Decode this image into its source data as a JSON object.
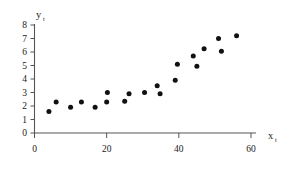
{
  "chart_data": {
    "type": "scatter",
    "title": "",
    "subtitle": "",
    "xlabel": "x",
    "xlabel_sub": "t",
    "ylabel": "y",
    "ylabel_sub": "t",
    "xlim": [
      0,
      62
    ],
    "ylim": [
      0,
      8
    ],
    "xticks": [
      0,
      20,
      40,
      60
    ],
    "xtick_labels": [
      "0",
      "20",
      "40",
      "60"
    ],
    "yticks": [
      0,
      1,
      2,
      3,
      4,
      5,
      6,
      7,
      8
    ],
    "ytick_labels": [
      "0",
      "1",
      "2",
      "3",
      "4",
      "5",
      "6",
      "7",
      "8"
    ],
    "grid": false,
    "legend": false,
    "legend_position": "none",
    "marker": "filled-circle",
    "marker_color": "#111111",
    "axis_color": "#555555",
    "background_color": "#ffffff",
    "series": [
      {
        "name": "observations",
        "points": [
          {
            "x": 4.0,
            "y": 1.6
          },
          {
            "x": 6.0,
            "y": 2.3
          },
          {
            "x": 10.0,
            "y": 1.9
          },
          {
            "x": 13.0,
            "y": 2.3
          },
          {
            "x": 16.8,
            "y": 1.9
          },
          {
            "x": 20.0,
            "y": 2.3
          },
          {
            "x": 20.2,
            "y": 3.0
          },
          {
            "x": 25.0,
            "y": 2.35
          },
          {
            "x": 26.2,
            "y": 2.9
          },
          {
            "x": 30.5,
            "y": 3.0
          },
          {
            "x": 34.0,
            "y": 3.5
          },
          {
            "x": 34.8,
            "y": 2.9
          },
          {
            "x": 39.0,
            "y": 3.9
          },
          {
            "x": 39.6,
            "y": 5.1
          },
          {
            "x": 44.0,
            "y": 5.7
          },
          {
            "x": 45.0,
            "y": 4.95
          },
          {
            "x": 47.0,
            "y": 6.25
          },
          {
            "x": 51.0,
            "y": 7.0
          },
          {
            "x": 51.8,
            "y": 6.05
          },
          {
            "x": 56.0,
            "y": 7.2
          }
        ]
      }
    ]
  },
  "figure": {
    "name": "scatter-plot-xt-yt"
  }
}
